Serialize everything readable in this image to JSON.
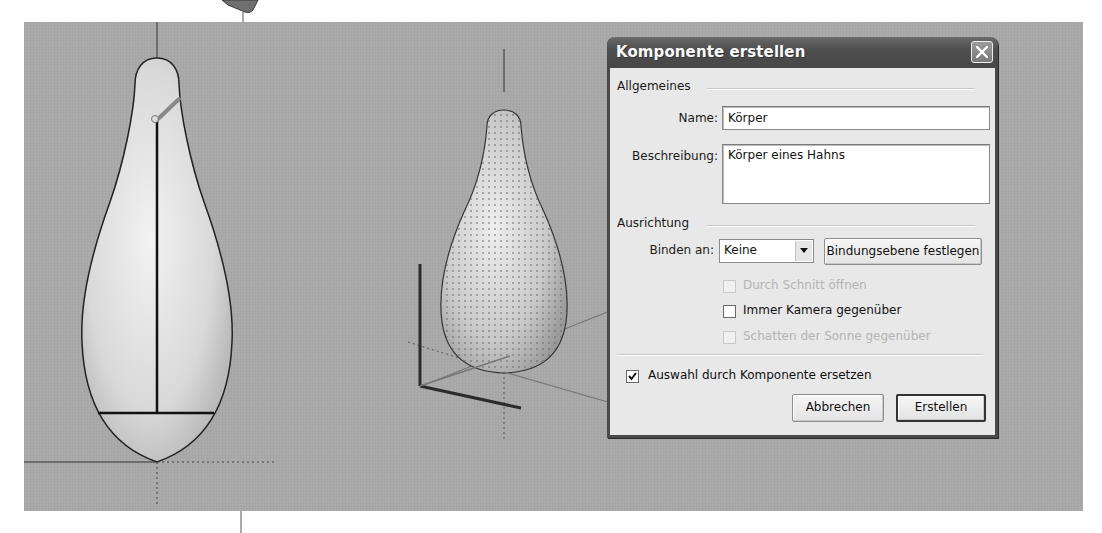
{
  "viewport": {
    "background": "#a9a9a9",
    "objects": [
      {
        "name": "left-shape",
        "view": "front, selected, with axis and handle"
      },
      {
        "name": "right-shape",
        "view": "perspective, dotted surface"
      }
    ]
  },
  "dialog": {
    "title": "Komponente erstellen",
    "close_icon": "close-icon",
    "general": {
      "heading": "Allgemeines",
      "name_label": "Name:",
      "name_value": "Körper",
      "description_label": "Beschreibung:",
      "description_value": "Körper eines Hahns"
    },
    "alignment": {
      "heading": "Ausrichtung",
      "bind_label": "Binden an:",
      "bind_value": "Keine",
      "set_plane_button": "Bindungsebene festlegen",
      "options": [
        {
          "label": "Durch Schnitt öffnen",
          "checked": false,
          "enabled": false
        },
        {
          "label": "Immer Kamera gegenüber",
          "checked": false,
          "enabled": true
        },
        {
          "label": "Schatten der Sonne gegenüber",
          "checked": false,
          "enabled": false
        }
      ]
    },
    "replace_selection": {
      "label": "Auswahl durch Komponente ersetzen",
      "checked": true
    },
    "buttons": {
      "cancel": "Abbrechen",
      "create": "Erstellen"
    }
  }
}
